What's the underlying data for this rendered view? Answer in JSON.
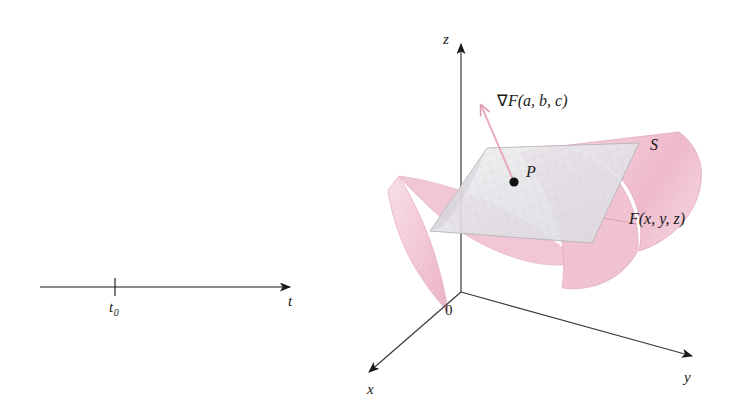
{
  "figure": {
    "background_color": "#ffffff",
    "line_color": "#1a1a1a",
    "surface_color": "#f2c8d4",
    "surface_edge_color": "#e5aabd",
    "plane_color": "#e9e9ec",
    "plane_edge_color": "#b8b8bd",
    "gradient_arrow_color": "#e8a6ba",
    "point_color": "#111111"
  },
  "left_panel": {
    "name": "t-number-line",
    "axis_label": "t",
    "tick_label": "t",
    "tick_subscript": "0",
    "tick_label_full": "t₀"
  },
  "right_panel": {
    "name": "3d-gradient-diagram",
    "axes": {
      "z_label": "z",
      "y_label": "y",
      "x_label": "x",
      "origin_label": "0"
    },
    "labels": {
      "gradient": "∇F(a, b, c)",
      "gradient_nabla": "∇",
      "gradient_F": "F",
      "gradient_args": "(a, b, c)",
      "point": "P",
      "surface": "S",
      "function": "F(x, y, z)",
      "function_F": "F",
      "function_args": "(x, y, z)"
    }
  }
}
